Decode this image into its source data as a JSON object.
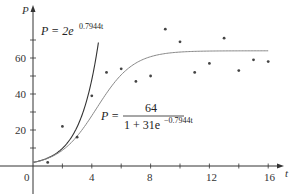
{
  "chart_data": {
    "type": "scatter",
    "title": "",
    "xlabel": "t",
    "ylabel": "P",
    "xlim": [
      0,
      17
    ],
    "ylim": [
      0,
      80
    ],
    "x_ticks": [
      0,
      2,
      4,
      6,
      8,
      10,
      12,
      14,
      16
    ],
    "x_tick_labels": [
      "0",
      "4",
      "8",
      "12",
      "16"
    ],
    "y_ticks": [
      10,
      20,
      30,
      40,
      50,
      60,
      70
    ],
    "y_tick_labels": [
      "20",
      "40",
      "60"
    ],
    "grid": false,
    "series": [
      {
        "name": "data",
        "kind": "scatter",
        "x": [
          1,
          2,
          3,
          4,
          5,
          6,
          7,
          8,
          9,
          10,
          11,
          12,
          13,
          14,
          15,
          16
        ],
        "values": [
          2,
          22,
          16,
          39,
          52,
          54,
          47,
          50,
          76,
          69,
          52,
          57,
          71,
          53,
          59,
          58
        ]
      },
      {
        "name": "P = 2e^{0.7944t}",
        "kind": "line",
        "formula": "2*exp(0.7944*t)"
      },
      {
        "name": "P = 64 / (1 + 31e^{-0.7944t})",
        "kind": "line",
        "formula": "64/(1+31*exp(-0.7944*t))"
      }
    ],
    "annotations": [
      {
        "text": "P = 2e^{0.7944t}",
        "near": "exponential curve"
      },
      {
        "text": "P = 64 / (1 + 31e^{-0.7944t})",
        "near": "logistic curve"
      }
    ]
  },
  "labels": {
    "x_axis": "t",
    "y_axis": "P",
    "origin": "0",
    "x_ticks": [
      "4",
      "8",
      "12",
      "16"
    ],
    "y_ticks": [
      "20",
      "40",
      "60"
    ],
    "exp_eq_lhs": "P = 2e",
    "exp_eq_sup": "0.7944t",
    "log_eq_lhs": "P =",
    "log_eq_num": "64",
    "log_eq_den": "1 + 31e",
    "log_eq_den_sup": "−0.7944t"
  },
  "colors": {
    "axis": "#333333",
    "exp_curve": "#333333",
    "log_curve": "#777777",
    "points": "#444444"
  }
}
